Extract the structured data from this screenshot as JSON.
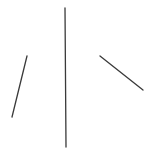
{
  "canvas": {
    "width": 159,
    "height": 153,
    "background": "#ffffff"
  },
  "lines": [
    {
      "name": "left-slanted-line",
      "x1": 27,
      "y1": 56,
      "x2": 12,
      "y2": 117,
      "color": "#3a3a3a",
      "width": 1.3
    },
    {
      "name": "center-vertical-line",
      "x1": 65,
      "y1": 8,
      "x2": 66,
      "y2": 147,
      "color": "#3a3a3a",
      "width": 1.3
    },
    {
      "name": "right-slanted-line",
      "x1": 100,
      "y1": 56,
      "x2": 143,
      "y2": 90,
      "color": "#3a3a3a",
      "width": 1.3
    }
  ]
}
